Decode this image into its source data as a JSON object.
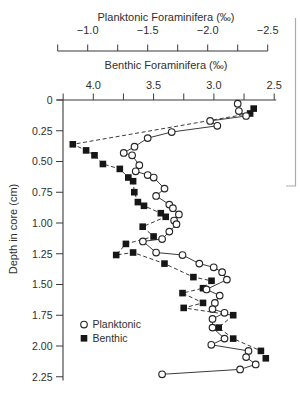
{
  "chart_data": {
    "type": "line",
    "top_axis": {
      "title": "Planktonic Foraminifera (‰)",
      "tick_labels": [
        "−1.0",
        "−1.5",
        "−2.0",
        "−2.5"
      ],
      "tick_values": [
        -1.0,
        -1.5,
        -2.0,
        -2.5
      ],
      "range": [
        -0.75,
        -2.5
      ],
      "minor_step": 0.25
    },
    "inner_axis": {
      "title": "Benthic Foraminifera (‰)",
      "tick_labels": [
        "4.0",
        "3.5",
        "3.0",
        "2.5"
      ],
      "tick_values": [
        4.0,
        3.5,
        3.0,
        2.5
      ],
      "range": [
        4.25,
        2.5
      ],
      "minor_step": 0.25
    },
    "depth_axis": {
      "title": "Depth in core (cm)",
      "tick_labels": [
        "0",
        "0.25",
        "0.50",
        "0.75",
        "1.00",
        "1.25",
        "1.50",
        "1.75",
        "2.00",
        "2.25"
      ],
      "tick_values": [
        0,
        0.25,
        0.5,
        0.75,
        1.0,
        1.25,
        1.5,
        1.75,
        2.0,
        2.25
      ],
      "range": [
        0,
        2.25
      ]
    },
    "legend": {
      "items": [
        {
          "label": "Planktonic",
          "marker": "open-circle"
        },
        {
          "label": "Benthic",
          "marker": "filled-square"
        }
      ]
    },
    "series": [
      {
        "name": "Planktonic",
        "axis": "top",
        "line": "solid",
        "marker": "open-circle",
        "points_depth_value": [
          [
            0.03,
            -2.25
          ],
          [
            0.09,
            -2.26
          ],
          [
            0.13,
            -2.32
          ],
          [
            0.17,
            -2.02
          ],
          [
            0.21,
            -2.08
          ],
          [
            0.26,
            -1.7
          ],
          [
            0.31,
            -1.5
          ],
          [
            0.38,
            -1.39
          ],
          [
            0.43,
            -1.3
          ],
          [
            0.45,
            -1.37
          ],
          [
            0.53,
            -1.43
          ],
          [
            0.58,
            -1.4
          ],
          [
            0.61,
            -1.5
          ],
          [
            0.63,
            -1.55
          ],
          [
            0.72,
            -1.64
          ],
          [
            0.78,
            -1.57
          ],
          [
            0.85,
            -1.68
          ],
          [
            0.88,
            -1.71
          ],
          [
            0.93,
            -1.76
          ],
          [
            0.98,
            -1.72
          ],
          [
            1.01,
            -1.74
          ],
          [
            1.07,
            -1.68
          ],
          [
            1.13,
            -1.62
          ],
          [
            1.15,
            -1.46
          ],
          [
            1.24,
            -1.57
          ],
          [
            1.26,
            -1.79
          ],
          [
            1.33,
            -1.93
          ],
          [
            1.36,
            -2.05
          ],
          [
            1.4,
            -2.12
          ],
          [
            1.46,
            -2.16
          ],
          [
            1.54,
            -1.99
          ],
          [
            1.59,
            -2.1
          ],
          [
            1.65,
            -2.06
          ],
          [
            1.7,
            -2.04
          ],
          [
            1.73,
            -2.14
          ],
          [
            1.78,
            -2.04
          ],
          [
            1.85,
            -2.04
          ],
          [
            1.94,
            -2.14
          ],
          [
            1.99,
            -2.03
          ],
          [
            2.04,
            -2.34
          ],
          [
            2.09,
            -2.32
          ],
          [
            2.15,
            -2.4
          ],
          [
            2.19,
            -2.27
          ],
          [
            2.23,
            -1.62
          ]
        ]
      },
      {
        "name": "Benthic",
        "axis": "inner",
        "line": "dashed",
        "marker": "filled-square",
        "points_depth_value": [
          [
            0.07,
            2.67
          ],
          [
            0.11,
            2.7
          ],
          [
            0.36,
            4.17
          ],
          [
            0.41,
            4.06
          ],
          [
            0.45,
            3.99
          ],
          [
            0.52,
            3.92
          ],
          [
            0.56,
            3.78
          ],
          [
            0.63,
            3.71
          ],
          [
            0.66,
            3.67
          ],
          [
            0.75,
            3.66
          ],
          [
            0.83,
            3.63
          ],
          [
            0.86,
            3.58
          ],
          [
            0.92,
            3.44
          ],
          [
            0.95,
            3.4
          ],
          [
            1.03,
            3.59
          ],
          [
            1.11,
            3.5
          ],
          [
            1.17,
            3.73
          ],
          [
            1.26,
            3.81
          ],
          [
            1.24,
            3.67
          ],
          [
            1.33,
            3.41
          ],
          [
            1.44,
            3.17
          ],
          [
            1.47,
            3.02
          ],
          [
            1.53,
            3.09
          ],
          [
            1.57,
            3.26
          ],
          [
            1.65,
            3.09
          ],
          [
            1.69,
            3.25
          ],
          [
            1.75,
            2.84
          ],
          [
            1.85,
            2.96
          ],
          [
            1.94,
            2.84
          ],
          [
            2.04,
            2.61
          ],
          [
            2.1,
            2.57
          ]
        ]
      }
    ],
    "colors": {
      "ink": "#3b3b3b",
      "marker_stroke": "#262626",
      "marker_fill_square": "#161616",
      "marker_fill_circle": "#ffffff",
      "background": "#ffffff",
      "edge_artifact": "#ababab"
    },
    "layout_hints": {
      "legend_position": "inside-lower-left",
      "grid": false,
      "depth_increases_downward": true
    }
  }
}
